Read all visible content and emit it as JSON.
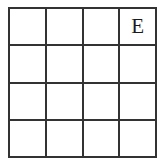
{
  "figure": {
    "kind": "grid-puzzle",
    "rows": 4,
    "columns": 4,
    "line_color": "#333333",
    "cell_background": "#ffffff",
    "page_background": "#ffffff",
    "text_color": "#1a1a1a"
  },
  "grid": {
    "cells": [
      {
        "id": "r1c1",
        "row": 1,
        "column": 1,
        "label": ""
      },
      {
        "id": "r1c2",
        "row": 1,
        "column": 2,
        "label": ""
      },
      {
        "id": "r1c3",
        "row": 1,
        "column": 3,
        "label": ""
      },
      {
        "id": "r1c4",
        "row": 1,
        "column": 4,
        "label": "E"
      },
      {
        "id": "r2c1",
        "row": 2,
        "column": 1,
        "label": ""
      },
      {
        "id": "r2c2",
        "row": 2,
        "column": 2,
        "label": ""
      },
      {
        "id": "r2c3",
        "row": 2,
        "column": 3,
        "label": ""
      },
      {
        "id": "r2c4",
        "row": 2,
        "column": 4,
        "label": ""
      },
      {
        "id": "r3c1",
        "row": 3,
        "column": 1,
        "label": ""
      },
      {
        "id": "r3c2",
        "row": 3,
        "column": 2,
        "label": ""
      },
      {
        "id": "r3c3",
        "row": 3,
        "column": 3,
        "label": ""
      },
      {
        "id": "r3c4",
        "row": 3,
        "column": 4,
        "label": ""
      },
      {
        "id": "r4c1",
        "row": 4,
        "column": 1,
        "label": ""
      },
      {
        "id": "r4c2",
        "row": 4,
        "column": 2,
        "label": ""
      },
      {
        "id": "r4c3",
        "row": 4,
        "column": 3,
        "label": ""
      },
      {
        "id": "r4c4",
        "row": 4,
        "column": 4,
        "label": ""
      }
    ]
  }
}
